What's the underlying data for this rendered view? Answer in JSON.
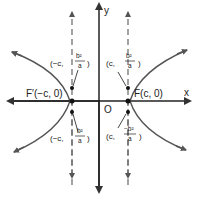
{
  "diagram": {
    "axes": {
      "x_label": "x",
      "y_label": "y",
      "origin_label": "O"
    },
    "foci": {
      "left": "F′(−c, 0)",
      "right": "F(c, 0)"
    },
    "latus_rectum_points": {
      "upper_left_prefix": "(−c,",
      "upper_right_prefix": "(c,",
      "lower_left_prefix": "(−c,",
      "lower_right_prefix": "(c,",
      "upper_num": "b²",
      "lower_num": "−b²",
      "den": "a",
      "close": ")"
    },
    "colors": {
      "curve": "#555555",
      "axis": "#222222",
      "dashed": "#666666",
      "text": "#222222"
    }
  }
}
